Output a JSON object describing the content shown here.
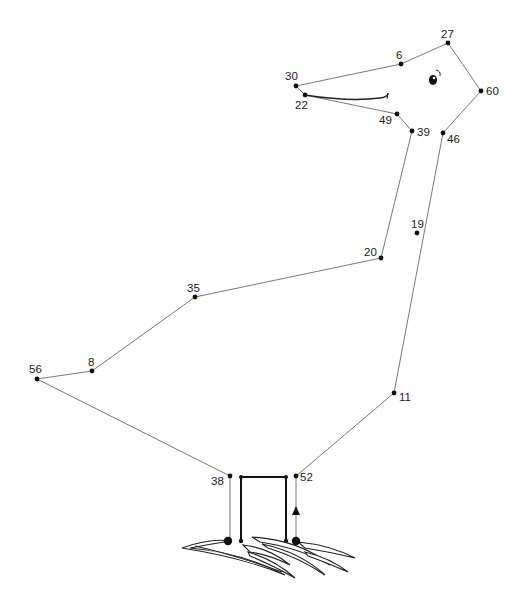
{
  "puzzle": {
    "type": "connect-the-dots",
    "subject": "bird (pelican/stork) standing on grass",
    "dots": [
      {
        "label": "27",
        "x": 448,
        "y": 43,
        "lx": 441,
        "ly": 38,
        "on_path": true
      },
      {
        "label": "6",
        "x": 401,
        "y": 64,
        "lx": 396,
        "ly": 59,
        "on_path": true
      },
      {
        "label": "30",
        "x": 296,
        "y": 86,
        "lx": 285,
        "ly": 80,
        "on_path": true
      },
      {
        "label": "22",
        "x": 305,
        "y": 95,
        "lx": 295,
        "ly": 109,
        "on_path": true
      },
      {
        "label": "60",
        "x": 481,
        "y": 91,
        "lx": 486,
        "ly": 95,
        "on_path": true
      },
      {
        "label": "49",
        "x": 397,
        "y": 114,
        "lx": 379,
        "ly": 124,
        "on_path": true
      },
      {
        "label": "39",
        "x": 412,
        "y": 131,
        "lx": 417,
        "ly": 136,
        "on_path": true
      },
      {
        "label": "46",
        "x": 443,
        "y": 133,
        "lx": 447,
        "ly": 143,
        "on_path": true
      },
      {
        "label": "19",
        "x": 417,
        "y": 233,
        "lx": 411,
        "ly": 228,
        "on_path": false
      },
      {
        "label": "20",
        "x": 381,
        "y": 258,
        "lx": 364,
        "ly": 256,
        "on_path": true
      },
      {
        "label": "35",
        "x": 195,
        "y": 297,
        "lx": 187,
        "ly": 292,
        "on_path": true
      },
      {
        "label": "8",
        "x": 92,
        "y": 371,
        "lx": 88,
        "ly": 366,
        "on_path": true
      },
      {
        "label": "56",
        "x": 37,
        "y": 379,
        "lx": 29,
        "ly": 373,
        "on_path": true
      },
      {
        "label": "11",
        "x": 394,
        "y": 393,
        "lx": 399,
        "ly": 401,
        "on_path": true
      },
      {
        "label": "38",
        "x": 230,
        "y": 476,
        "lx": 211,
        "ly": 485,
        "on_path": true
      },
      {
        "label": "52",
        "x": 296,
        "y": 476,
        "lx": 300,
        "ly": 481,
        "on_path": true
      }
    ],
    "path_order": [
      "27",
      "6",
      "30",
      "22",
      "49",
      "39",
      "20",
      "35",
      "8",
      "56",
      "38"
    ],
    "path_right": [
      "27",
      "60",
      "46",
      "11",
      "52"
    ],
    "colors": {
      "line": "#555555",
      "dot": "#111111",
      "text": "#1a1a1a",
      "background": "#ffffff"
    }
  }
}
